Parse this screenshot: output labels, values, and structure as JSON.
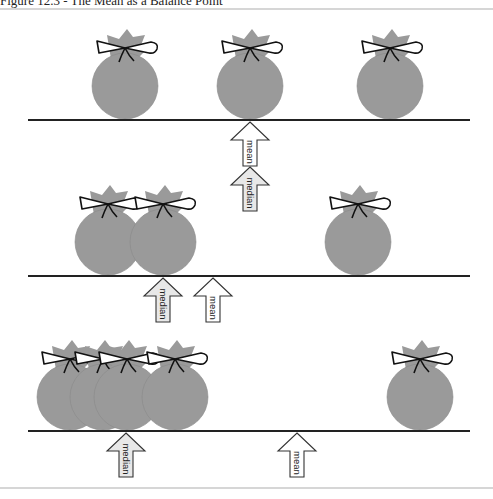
{
  "title": "Figure 12.3 - The Mean as a Balance Point",
  "colors": {
    "bag": "#9a9a9a",
    "beam": "#222222",
    "border": "#c8c8c8",
    "arrow_mean_fill": "#ffffff",
    "arrow_median_fill": "#e8e8e8"
  },
  "labels": {
    "mean": "mean",
    "median": "median"
  },
  "rows": [
    {
      "beam_y": 120,
      "bags": [
        125,
        250,
        390
      ],
      "arrows": [
        {
          "type": "mean",
          "x": 250,
          "tip_y": 122
        },
        {
          "type": "median",
          "x": 250,
          "tip_y": 167
        }
      ]
    },
    {
      "beam_y": 276,
      "bags": [
        108,
        163,
        358
      ],
      "arrows": [
        {
          "type": "median",
          "x": 163,
          "tip_y": 278
        },
        {
          "type": "mean",
          "x": 213,
          "tip_y": 278
        }
      ]
    },
    {
      "beam_y": 431,
      "bags": [
        70,
        103,
        127,
        175,
        420
      ],
      "arrows": [
        {
          "type": "median",
          "x": 126,
          "tip_y": 433
        },
        {
          "type": "mean",
          "x": 297,
          "tip_y": 433
        }
      ]
    }
  ]
}
